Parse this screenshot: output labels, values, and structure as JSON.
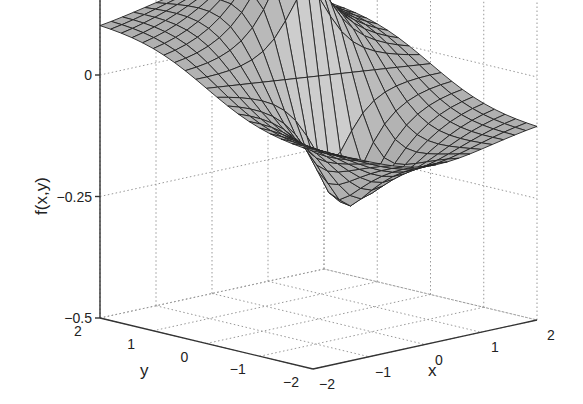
{
  "chart_data": {
    "type": "surface3d",
    "title": "",
    "xlabel": "x",
    "ylabel": "y",
    "zlabel": "f(x,y)",
    "xlim": [
      -2,
      2
    ],
    "ylim": [
      -2,
      2
    ],
    "zlim": [
      -0.5,
      0.5
    ],
    "grid": true,
    "legend": null,
    "x_ticks": [
      -2,
      -1,
      0,
      1,
      2
    ],
    "y_ticks": [
      -2,
      -1,
      0,
      1,
      2
    ],
    "z_ticks": [
      -0.5,
      -0.25,
      0,
      0.25,
      0.5
    ],
    "x_tick_labels": [
      "−2",
      "−1",
      "0",
      "1",
      "2"
    ],
    "y_tick_labels": [
      "−2",
      "−1",
      "0",
      "1",
      "2"
    ],
    "z_tick_labels": [
      "−0.5",
      "−0.25",
      "0",
      "0.25",
      "0.5"
    ],
    "mesh": {
      "nx": 21,
      "ny": 21
    },
    "surface_description": "Dipole-like surface: sharp peak (~0.5) near origin on the positive-y side, sharp trough (~-0.5) near origin on the negative-y side, flattening toward ~0.1 at corner (x=-2,y=2) and ~0 at corner (x=2,y=-2).",
    "key_values": [
      {
        "x": 0,
        "y": 0.2,
        "z": 0.5
      },
      {
        "x": 0,
        "y": -0.2,
        "z": -0.5
      },
      {
        "x": -2,
        "y": 2,
        "z": 0.1
      },
      {
        "x": 2,
        "y": -2,
        "z": 0.0
      }
    ],
    "surface_color": "#a9a9a9",
    "edge_color": "#222222"
  }
}
